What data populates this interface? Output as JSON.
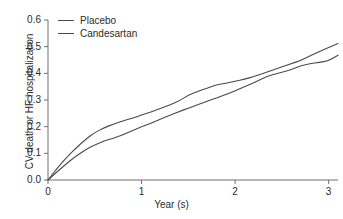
{
  "chart_data": {
    "type": "line",
    "title": "",
    "subtitle": "",
    "xlabel": "Year (s)",
    "ylabel": "CV death or HF hospitalization",
    "xlim": [
      0,
      3.1
    ],
    "ylim": [
      0.0,
      0.6
    ],
    "grid": false,
    "legend_position": "top-left",
    "xticks": [
      "0",
      "1",
      "2",
      "3"
    ],
    "xtick_values": [
      0,
      1,
      2,
      3
    ],
    "yticks": [
      "0.0",
      "0.1",
      "0.2",
      "0.3",
      "0.4",
      "0.5",
      "0.6"
    ],
    "ytick_values": [
      0.0,
      0.1,
      0.2,
      0.3,
      0.4,
      0.5,
      0.6
    ],
    "x": [
      0,
      0.1,
      0.2,
      0.3,
      0.4,
      0.5,
      0.6,
      0.7,
      0.8,
      0.9,
      1.0,
      1.1,
      1.2,
      1.3,
      1.4,
      1.5,
      1.6,
      1.7,
      1.8,
      1.9,
      2.0,
      2.1,
      2.2,
      2.3,
      2.4,
      2.5,
      2.6,
      2.7,
      2.8,
      2.9,
      3.0,
      3.1
    ],
    "series": [
      {
        "name": "Placebo",
        "color": "#4a4a4a",
        "values": [
          0.0,
          0.045,
          0.085,
          0.12,
          0.152,
          0.178,
          0.196,
          0.21,
          0.222,
          0.232,
          0.243,
          0.255,
          0.268,
          0.281,
          0.296,
          0.318,
          0.332,
          0.345,
          0.357,
          0.363,
          0.37,
          0.378,
          0.388,
          0.4,
          0.412,
          0.424,
          0.436,
          0.448,
          0.465,
          0.481,
          0.497,
          0.512
        ]
      },
      {
        "name": "Candesartan",
        "color": "#4a4a4a",
        "values": [
          0.0,
          0.032,
          0.062,
          0.09,
          0.113,
          0.132,
          0.146,
          0.157,
          0.17,
          0.185,
          0.2,
          0.213,
          0.228,
          0.242,
          0.256,
          0.27,
          0.282,
          0.295,
          0.308,
          0.32,
          0.334,
          0.35,
          0.365,
          0.382,
          0.396,
          0.403,
          0.414,
          0.428,
          0.436,
          0.441,
          0.447,
          0.468
        ]
      }
    ],
    "annotations": []
  },
  "legend": {
    "entries": [
      {
        "label": "Placebo"
      },
      {
        "label": "Candesartan"
      }
    ]
  },
  "colors": {
    "line": "#4a4a4a",
    "axis": "#6f6f6f",
    "text": "#2b2b2b",
    "background": "#ffffff"
  }
}
